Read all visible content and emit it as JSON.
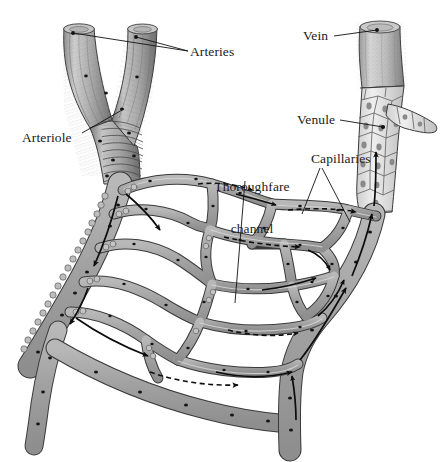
{
  "figure": {
    "width": 441,
    "height": 462,
    "background_color": "#ffffff",
    "clipped_caption_fragment": "capillaries in smooth muscle of the arterioles",
    "line_color": "#111111",
    "vessel_fill": "#a9a9a9",
    "vessel_fill_light": "#c9c9c9",
    "vessel_outline": "#3a3a3a",
    "endothelial_fill": "#e2e2e2"
  },
  "labels": [
    {
      "id": "arteries",
      "text": "Arteries",
      "x": 190,
      "y": 45,
      "align": "left"
    },
    {
      "id": "vein",
      "text": "Vein",
      "x": 303,
      "y": 29,
      "align": "left"
    },
    {
      "id": "arteriole",
      "text": "Arteriole",
      "x": 22,
      "y": 131,
      "align": "left"
    },
    {
      "id": "venule",
      "text": "Venule",
      "x": 297,
      "y": 113,
      "align": "left"
    },
    {
      "id": "thoroughfare-channel",
      "text": "Thoroughfare\nchannel",
      "line1": "Thoroughfare",
      "line2": "channel",
      "x": 216,
      "y": 152,
      "align": "center"
    },
    {
      "id": "capillaries",
      "text": "Capillaries",
      "x": 311,
      "y": 152,
      "align": "left"
    }
  ],
  "leader_lines": [
    {
      "id": "arteries-leader-left",
      "from": [
        188,
        51
      ],
      "to": [
        73,
        33
      ]
    },
    {
      "id": "arteries-leader-right",
      "from": [
        188,
        51
      ],
      "to": [
        136,
        37
      ]
    },
    {
      "id": "vein-leader",
      "from": [
        334,
        36
      ],
      "to": [
        377,
        30
      ]
    },
    {
      "id": "arteriole-leader",
      "from": [
        82,
        133
      ],
      "to": [
        122,
        110
      ]
    },
    {
      "id": "venule-leader",
      "from": [
        340,
        120
      ],
      "to": [
        383,
        127
      ]
    },
    {
      "id": "thoroughfare-leader",
      "from": [
        245,
        180
      ],
      "to": [
        235,
        302
      ]
    },
    {
      "id": "capillaries-leader-1",
      "from": [
        320,
        168
      ],
      "to": [
        303,
        213
      ]
    },
    {
      "id": "capillaries-leader-2",
      "from": [
        322,
        168
      ],
      "to": [
        349,
        221
      ]
    }
  ],
  "annotations": {
    "flow_arrows_description": "Solid arrows indicate direction of blood flow from arteriole through the capillary bed into the venule; dashed arrows indicate flow through thoroughfare channels.",
    "arrow_count_arterial": 6,
    "arrow_count_venous": 5,
    "dashed_channel_count": 4
  }
}
